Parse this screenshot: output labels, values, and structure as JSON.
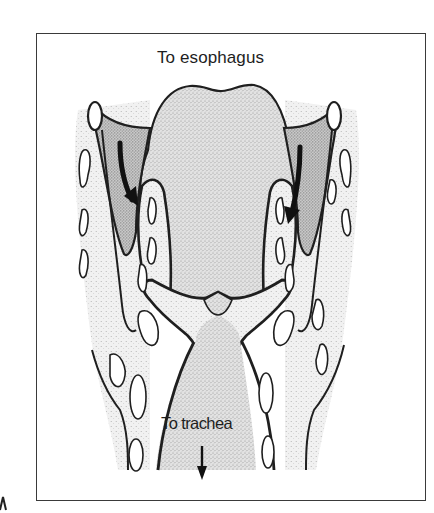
{
  "figure": {
    "labels": {
      "top": "To esophagus",
      "bottom": "To trachea"
    },
    "arrows": [
      {
        "name": "left-flow-arrow",
        "direction": "down-right"
      },
      {
        "name": "right-flow-arrow",
        "direction": "down-left"
      },
      {
        "name": "trachea-arrow",
        "direction": "down"
      }
    ],
    "colors": {
      "line": "#1f1f1f",
      "stipple_light": "#d6d6d6",
      "stipple_dark": "#a8a8a8",
      "background": "#ffffff",
      "frame": "#3a3a3a"
    }
  }
}
